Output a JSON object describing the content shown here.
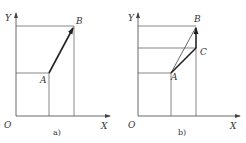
{
  "panels": [
    {
      "caption": "a)",
      "axes": {
        "x_label": "X",
        "y_label": "Y",
        "origin_label": "O"
      },
      "points": {
        "A": "A",
        "B": "B"
      }
    },
    {
      "caption": "b)",
      "axes": {
        "x_label": "X",
        "y_label": "Y",
        "origin_label": "O"
      },
      "points": {
        "A": "A",
        "B": "B",
        "C": "C"
      }
    }
  ],
  "colors": {
    "line": "#555555",
    "vector": "#222222",
    "background": "#ffffff"
  }
}
